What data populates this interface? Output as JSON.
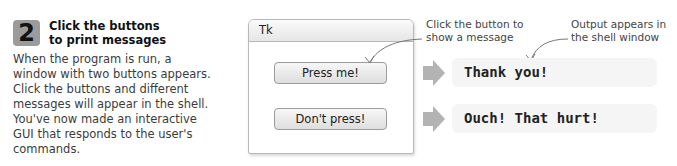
{
  "step": {
    "number": "2",
    "title_line1": "Click the buttons",
    "title_line2": "to print messages",
    "body": "When the program is run, a window with two buttons appears. Click the buttons and different messages will appear in the shell. You've now made an interactive GUI that responds to the user's commands."
  },
  "tk_window": {
    "title": "Tk",
    "buttons": [
      {
        "label": "Press me!"
      },
      {
        "label": "Don't press!"
      }
    ]
  },
  "callouts": {
    "button": {
      "line1": "Click the button to",
      "line2": "show a message"
    },
    "output": {
      "line1": "Output appears in",
      "line2": "the shell window"
    }
  },
  "shell_output": [
    {
      "text": "Thank you!"
    },
    {
      "text": "Ouch! That hurt!"
    }
  ],
  "colors": {
    "badge": "#9b9b9b",
    "arrow": "#b3b3b3",
    "output_bg": "#f5f5f5"
  }
}
